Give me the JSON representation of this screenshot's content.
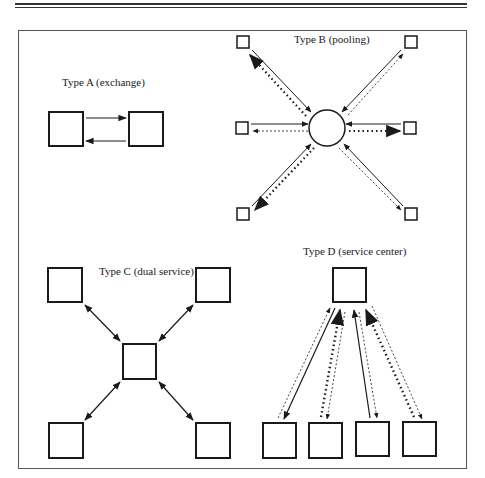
{
  "figure": {
    "panels": [
      {
        "id": "A",
        "title": "Type A (exchange)"
      },
      {
        "id": "B",
        "title": "Type B (pooling)"
      },
      {
        "id": "C",
        "title": "Type C (dual service)"
      },
      {
        "id": "D",
        "title": "Type D (service center)"
      }
    ]
  },
  "colors": {
    "line": "#1a1a1a",
    "frame": "#555555",
    "background": "#ffffff"
  }
}
